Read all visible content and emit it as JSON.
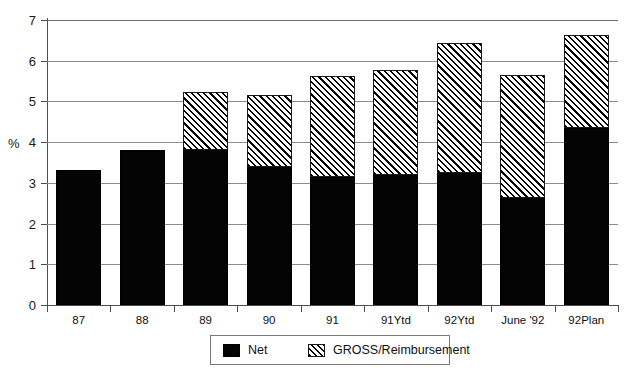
{
  "chart_data": {
    "type": "bar",
    "stacked": true,
    "title": "",
    "subtitle": "",
    "xlabel": "",
    "ylabel": "%",
    "ylim": [
      0,
      7
    ],
    "ytick_step": 1,
    "yticks": [
      0,
      1,
      2,
      3,
      4,
      5,
      6,
      7
    ],
    "ytick_labels": [
      "0",
      "1",
      "2",
      "3",
      "4",
      "5",
      "6",
      "7"
    ],
    "grid": true,
    "grid_axis": "y",
    "legend_position": "bottom-center",
    "categories": [
      "87",
      "88",
      "89",
      "90",
      "91",
      "91Ytd",
      "92Ytd",
      "June '92",
      "92Plan"
    ],
    "series": [
      {
        "name": "Net",
        "color": "#000000",
        "fill": "solid-black",
        "values": [
          3.32,
          3.8,
          3.8,
          3.38,
          3.14,
          3.2,
          3.25,
          2.63,
          4.35
        ]
      },
      {
        "name": "GROSS/Reimbursement",
        "color": "#000000",
        "fill": "diagonal-hatch",
        "values": [
          0.0,
          0.0,
          1.4,
          1.75,
          2.45,
          2.55,
          3.15,
          3.0,
          2.25
        ]
      }
    ],
    "totals": [
      3.32,
      3.8,
      5.2,
      5.13,
      5.59,
      5.75,
      6.4,
      5.63,
      6.6
    ]
  },
  "legend": {
    "entries": [
      {
        "label": "Net",
        "swatch": "solid-black-swatch"
      },
      {
        "label": "GROSS/Reimbursement",
        "swatch": "diagonal-hatch-swatch"
      }
    ]
  },
  "axis": {
    "y_title": "%"
  }
}
